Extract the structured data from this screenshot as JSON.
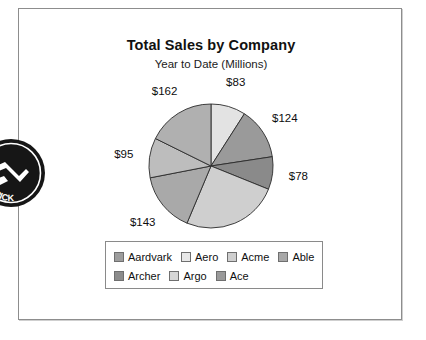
{
  "document": {
    "frame_present": true,
    "background_color": "#ffffff",
    "border_color": "#8d8d8d"
  },
  "chart_data": {
    "type": "pie",
    "title": "Total Sales by Company",
    "subtitle": "Year to Date (Millions)",
    "xlabel": "",
    "ylabel": "",
    "grid": false,
    "legend_position": "bottom",
    "value_prefix": "$",
    "total": 916,
    "categories": [
      "Aardvark",
      "Aero",
      "Acme",
      "Able",
      "Archer",
      "Argo",
      "Ace"
    ],
    "values": [
      162,
      83,
      124,
      78,
      231,
      143,
      95
    ],
    "labels": [
      "$162",
      "$83",
      "$124",
      "$78",
      "$231",
      "$143",
      "$95"
    ],
    "colors": [
      "#9d9d9d",
      "#e3e3e3",
      "#c4c4c4",
      "#8a8a8a",
      "#b2b2b2",
      "#cdcdcd",
      "#a6a6a6"
    ],
    "slices": [
      {
        "name": "Aero",
        "value": 83,
        "label": "$83",
        "color": "#e3e3e3"
      },
      {
        "name": "Acme",
        "value": 124,
        "label": "$124",
        "color": "#9a9a9a"
      },
      {
        "name": "Able",
        "value": 78,
        "label": "$78",
        "color": "#8a8a8a"
      },
      {
        "name": "Archer",
        "value": 231,
        "label": "$231",
        "color": "#cfcfcf"
      },
      {
        "name": "Argo",
        "value": 143,
        "label": "$143",
        "color": "#a9a9a9"
      },
      {
        "name": "Ace",
        "value": 95,
        "label": "$95",
        "color": "#bdbdbd"
      },
      {
        "name": "Aardvark",
        "value": 162,
        "label": "$162",
        "color": "#b0b0b0"
      }
    ]
  },
  "legend": {
    "row1": [
      {
        "label": "Aardvark",
        "color": "#9d9d9d"
      },
      {
        "label": "Aero",
        "color": "#e8e8e8"
      },
      {
        "label": "Acme",
        "color": "#cfcfcf"
      },
      {
        "label": "Able",
        "color": "#a8a8a8"
      }
    ],
    "row2": [
      {
        "label": "Archer",
        "color": "#8c8c8c"
      },
      {
        "label": "Argo",
        "color": "#d6d6d6"
      },
      {
        "label": "Ace",
        "color": "#9a9a9a"
      }
    ]
  },
  "stamp": {
    "name": "circular-stamp",
    "text_top": "S",
    "text_bottom": "TRICK",
    "color": "#1a1a1a"
  }
}
